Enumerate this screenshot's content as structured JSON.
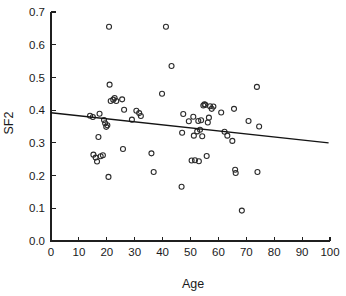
{
  "chart_data": {
    "type": "scatter",
    "title": "",
    "xlabel": "Age",
    "ylabel": "SF2",
    "xlim": [
      0,
      100
    ],
    "ylim": [
      0.0,
      0.7
    ],
    "grid": false,
    "legend": null,
    "xticks": [
      "0",
      "10",
      "20",
      "30",
      "40",
      "50",
      "60",
      "70",
      "80",
      "90",
      "100"
    ],
    "xtick_values": [
      0,
      10,
      20,
      30,
      40,
      50,
      60,
      70,
      80,
      90,
      100
    ],
    "yticks": [
      "0.0",
      "0.1",
      "0.2",
      "0.3",
      "0.4",
      "0.5",
      "0.6",
      "0.7"
    ],
    "ytick_values": [
      0.0,
      0.1,
      0.2,
      0.3,
      0.4,
      0.5,
      0.6,
      0.7
    ],
    "marker": "open-circle",
    "marker_color": "#2b2b2b",
    "points": [
      {
        "x": 14.0,
        "y": 0.383
      },
      {
        "x": 15.0,
        "y": 0.379
      },
      {
        "x": 15.2,
        "y": 0.264
      },
      {
        "x": 16.0,
        "y": 0.255
      },
      {
        "x": 16.5,
        "y": 0.243
      },
      {
        "x": 17.0,
        "y": 0.318
      },
      {
        "x": 17.4,
        "y": 0.389
      },
      {
        "x": 17.8,
        "y": 0.259
      },
      {
        "x": 18.6,
        "y": 0.262
      },
      {
        "x": 19.0,
        "y": 0.37
      },
      {
        "x": 19.4,
        "y": 0.36
      },
      {
        "x": 19.8,
        "y": 0.349
      },
      {
        "x": 20.2,
        "y": 0.354
      },
      {
        "x": 20.6,
        "y": 0.196
      },
      {
        "x": 20.8,
        "y": 0.655
      },
      {
        "x": 21.0,
        "y": 0.478
      },
      {
        "x": 21.4,
        "y": 0.428
      },
      {
        "x": 22.3,
        "y": 0.432
      },
      {
        "x": 22.8,
        "y": 0.437
      },
      {
        "x": 23.4,
        "y": 0.428
      },
      {
        "x": 25.5,
        "y": 0.433
      },
      {
        "x": 25.8,
        "y": 0.281
      },
      {
        "x": 26.2,
        "y": 0.401
      },
      {
        "x": 29.0,
        "y": 0.371
      },
      {
        "x": 30.6,
        "y": 0.398
      },
      {
        "x": 31.6,
        "y": 0.391
      },
      {
        "x": 32.2,
        "y": 0.382
      },
      {
        "x": 36.0,
        "y": 0.268
      },
      {
        "x": 36.8,
        "y": 0.211
      },
      {
        "x": 39.8,
        "y": 0.45
      },
      {
        "x": 41.2,
        "y": 0.655
      },
      {
        "x": 43.2,
        "y": 0.535
      },
      {
        "x": 46.8,
        "y": 0.166
      },
      {
        "x": 47.0,
        "y": 0.331
      },
      {
        "x": 47.4,
        "y": 0.388
      },
      {
        "x": 49.4,
        "y": 0.366
      },
      {
        "x": 50.4,
        "y": 0.246
      },
      {
        "x": 51.0,
        "y": 0.38
      },
      {
        "x": 51.2,
        "y": 0.322
      },
      {
        "x": 51.6,
        "y": 0.247
      },
      {
        "x": 52.4,
        "y": 0.335
      },
      {
        "x": 52.8,
        "y": 0.367
      },
      {
        "x": 53.0,
        "y": 0.244
      },
      {
        "x": 53.4,
        "y": 0.34
      },
      {
        "x": 53.8,
        "y": 0.369
      },
      {
        "x": 54.2,
        "y": 0.32
      },
      {
        "x": 54.6,
        "y": 0.414
      },
      {
        "x": 55.0,
        "y": 0.418
      },
      {
        "x": 55.3,
        "y": 0.416
      },
      {
        "x": 55.8,
        "y": 0.26
      },
      {
        "x": 56.2,
        "y": 0.362
      },
      {
        "x": 56.6,
        "y": 0.377
      },
      {
        "x": 57.0,
        "y": 0.412
      },
      {
        "x": 57.6,
        "y": 0.404
      },
      {
        "x": 58.2,
        "y": 0.411
      },
      {
        "x": 61.0,
        "y": 0.393
      },
      {
        "x": 62.2,
        "y": 0.334
      },
      {
        "x": 63.2,
        "y": 0.322
      },
      {
        "x": 65.0,
        "y": 0.306
      },
      {
        "x": 65.6,
        "y": 0.404
      },
      {
        "x": 66.0,
        "y": 0.218
      },
      {
        "x": 66.2,
        "y": 0.208
      },
      {
        "x": 68.4,
        "y": 0.093
      },
      {
        "x": 70.8,
        "y": 0.367
      },
      {
        "x": 73.8,
        "y": 0.471
      },
      {
        "x": 74.0,
        "y": 0.211
      },
      {
        "x": 74.6,
        "y": 0.35
      }
    ],
    "trendline": {
      "type": "linear-fit",
      "x_start": 0,
      "y_start": 0.392,
      "x_end": 99.5,
      "y_end": 0.3,
      "color": "#141414"
    }
  }
}
